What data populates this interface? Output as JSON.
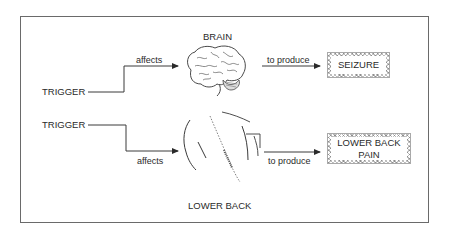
{
  "diagram": {
    "top_row": {
      "trigger_label": "TRIGGER",
      "affects_label": "affects",
      "organ_label": "BRAIN",
      "produce_label": "to produce",
      "outcome_label": "SEIZURE",
      "illustration": "brain-icon"
    },
    "bottom_row": {
      "trigger_label": "TRIGGER",
      "affects_label": "affects",
      "organ_label": "LOWER BACK",
      "produce_label": "to produce",
      "outcome_label_line1": "LOWER BACK",
      "outcome_label_line2": "PAIN",
      "illustration": "lower-back-icon"
    },
    "colors": {
      "line": "#3a3a3a",
      "frame": "#6a6a6a",
      "box_hatch": "#b9b9b9"
    }
  }
}
